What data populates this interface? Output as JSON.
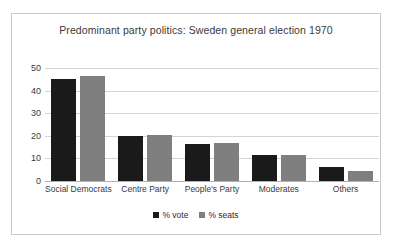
{
  "chart_data": {
    "type": "bar",
    "title": "Predominant party politics: Sweden general election 1970",
    "xlabel": "",
    "ylabel": "",
    "categories": [
      "Social Democrats",
      "Centre Party",
      "People's Party",
      "Moderates",
      "Others"
    ],
    "series": [
      {
        "name": "% vote",
        "color": "#1a1a1a",
        "values": [
          45.3,
          19.9,
          16.2,
          11.5,
          6.3
        ]
      },
      {
        "name": "% seats",
        "color": "#7f7f7f",
        "values": [
          46.6,
          20.3,
          16.6,
          11.7,
          4.3
        ]
      }
    ],
    "ylim": [
      0,
      50
    ],
    "yticks": [
      "0",
      "10",
      "20",
      "30",
      "40",
      "50"
    ],
    "grid": true,
    "legend_position": "bottom"
  }
}
